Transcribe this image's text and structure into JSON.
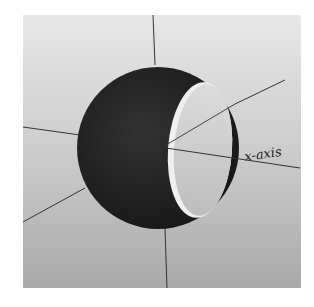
{
  "figure": {
    "axis_label": "x-axis",
    "colors": {
      "sphere": "#1f1f1f",
      "cut_face": "#cfcfcf",
      "axis_lines": "#333333",
      "background_top": "#e8e8e8",
      "background_bottom": "#a9a9a9"
    }
  }
}
